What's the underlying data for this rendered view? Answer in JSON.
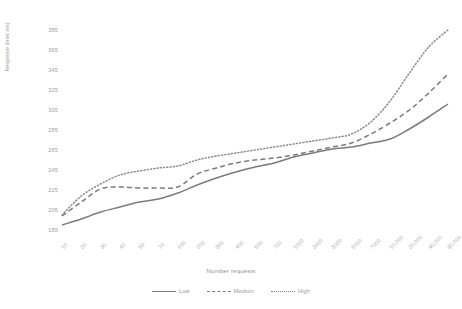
{
  "chart_data": {
    "type": "line",
    "title": "",
    "xlabel": "Number requests",
    "ylabel": "Response time( ms)",
    "grid": false,
    "legend_position": "bottom",
    "ylim": [
      175,
      395
    ],
    "yticks": [
      185,
      205,
      225,
      245,
      265,
      285,
      305,
      325,
      345,
      365,
      385
    ],
    "categories": [
      "10",
      "20",
      "30",
      "40",
      "50",
      "70",
      "100",
      "200",
      "300",
      "400",
      "500",
      "700",
      "1000",
      "2000",
      "3000",
      "5000",
      "7000",
      "10,000",
      "20,000",
      "40,000",
      "80,000"
    ],
    "series": [
      {
        "name": "Low",
        "style": "solid",
        "color": "#7b7b7b",
        "values": [
          190,
          196,
          203,
          208,
          213,
          216,
          222,
          230,
          237,
          243,
          248,
          252,
          258,
          262,
          266,
          268,
          272,
          276,
          286,
          298,
          311
        ]
      },
      {
        "name": "Medium",
        "style": "dashed",
        "color": "#7b7b7b",
        "values": [
          199,
          213,
          226,
          228,
          227,
          227,
          228,
          241,
          247,
          252,
          255,
          257,
          260,
          264,
          268,
          272,
          281,
          292,
          305,
          322,
          341
        ]
      },
      {
        "name": "High",
        "style": "dotted",
        "color": "#8a8a8a",
        "values": [
          200,
          219,
          231,
          240,
          244,
          247,
          249,
          255,
          259,
          262,
          265,
          268,
          271,
          274,
          277,
          281,
          293,
          314,
          342,
          368,
          385
        ]
      }
    ]
  },
  "legend": {
    "items": [
      {
        "label": "Low",
        "style": "solid"
      },
      {
        "label": "Medium",
        "style": "dashed"
      },
      {
        "label": "High",
        "style": "dotted"
      }
    ]
  }
}
